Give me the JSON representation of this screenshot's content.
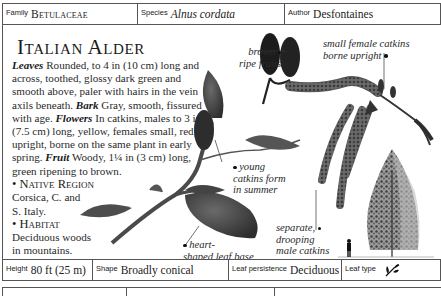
{
  "header": {
    "family_label": "Family",
    "family_value": "Betulaceae",
    "species_label": "Species",
    "species_value": "Alnus cordata",
    "author_label": "Author",
    "author_value": "Desfontaines"
  },
  "title": "Italian Alder",
  "description": {
    "leaves_label": "Leaves",
    "leaves_text": " Rounded, to 4 in (10 cm) long and across, toothed, glossy dark green and smooth above, paler with hairs in the vein axils beneath. ",
    "bark_label": "Bark",
    "bark_text": " Gray, smooth, fissured with age. ",
    "flowers_label": "Flowers",
    "flowers_text": " In catkins, males to 3 in (7.5 cm) long, yellow, females small, red, upright, borne on the same plant in early spring. ",
    "fruit_label": "Fruit",
    "fruit_text": " Woody, 1¼ in (3 cm) long, green ripening to brown.",
    "native_region_heading": "• Native Region",
    "native_region_line1": "Corsica, C. and",
    "native_region_line2": "S. Italy.",
    "habitat_heading": "• Habitat",
    "habitat_line1": "Deciduous woods",
    "habitat_line2": "in mountains."
  },
  "annotations": {
    "ripe_fruits_line1": "brown",
    "ripe_fruits_line2": "ripe fruits",
    "female_catkins_line1": "small female catkins",
    "female_catkins_line2": "borne upright",
    "young_catkins_line1": "young",
    "young_catkins_line2": "catkins form",
    "young_catkins_line3": "in summer",
    "leaf_base_line1": "heart-",
    "leaf_base_line2": "shaped leaf base",
    "male_catkins_line1": "separate,",
    "male_catkins_line2": "drooping",
    "male_catkins_line3": "male catkins"
  },
  "footer": {
    "height_label": "Height",
    "height_value": "80 ft (25 m)",
    "shape_label": "Shape",
    "shape_value": "Broadly conical",
    "leaf_persistence_label": "Leaf persistence",
    "leaf_persistence_value": "Deciduous",
    "leaf_type_label": "Leaf type",
    "leaf_type_icon": "simple-leaf-icon"
  },
  "colors": {
    "border": "#555555",
    "text": "#1e1e1e",
    "leaf_dark": "#3f3f3f",
    "catkin": "#5a5a5a"
  }
}
